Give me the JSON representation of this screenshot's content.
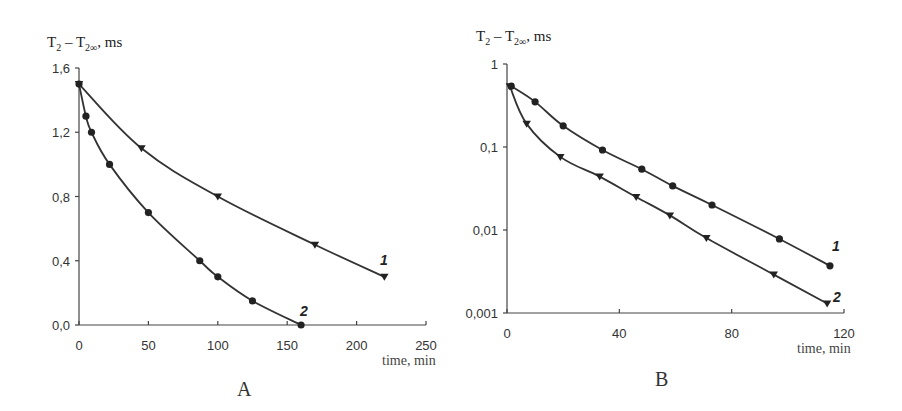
{
  "chart_data": [
    {
      "panel": "A",
      "type": "line",
      "title": "",
      "ylabel": "T2 – T2∞, ms",
      "xlabel": "time, min",
      "xlim": [
        0,
        250
      ],
      "ylim": [
        0,
        1.6
      ],
      "yscale": "linear",
      "x_ticks": [
        "0",
        "50",
        "100",
        "150",
        "200",
        "250"
      ],
      "y_ticks": [
        "0,0",
        "0,4",
        "0,8",
        "1,2",
        "1,6"
      ],
      "grid": false,
      "series": [
        {
          "name": "1",
          "marker": "triangle-down",
          "x": [
            0,
            45,
            100,
            170,
            220
          ],
          "y": [
            1.5,
            1.1,
            0.8,
            0.5,
            0.3
          ]
        },
        {
          "name": "2",
          "marker": "circle",
          "x": [
            0,
            5,
            9,
            22,
            50,
            87,
            100,
            125,
            160
          ],
          "y": [
            1.5,
            1.3,
            1.2,
            1.0,
            0.7,
            0.4,
            0.3,
            0.15,
            0.0
          ]
        }
      ]
    },
    {
      "panel": "B",
      "type": "line",
      "title": "",
      "ylabel": "T2 – T2∞, ms",
      "xlabel": "time, min",
      "xlim": [
        0,
        120
      ],
      "ylim": [
        0.001,
        1
      ],
      "yscale": "log",
      "x_ticks": [
        "0",
        "40",
        "80",
        "120"
      ],
      "y_ticks": [
        "0,001",
        "0,01",
        "0,1",
        "1"
      ],
      "grid": false,
      "series": [
        {
          "name": "1",
          "marker": "circle",
          "x": [
            1.5,
            10,
            20,
            34,
            48,
            59,
            73,
            97,
            115
          ],
          "y": [
            0.54,
            0.35,
            0.18,
            0.092,
            0.054,
            0.034,
            0.02,
            0.0078,
            0.0037
          ]
        },
        {
          "name": "2",
          "marker": "triangle-down",
          "x": [
            1,
            7,
            19,
            33,
            46,
            58,
            71,
            95,
            114
          ],
          "y": [
            0.54,
            0.19,
            0.076,
            0.044,
            0.025,
            0.015,
            0.008,
            0.0029,
            0.0013
          ]
        }
      ]
    }
  ],
  "labels": {
    "a": {
      "ylabel_main": "T",
      "ylabel_sub1": "2",
      "ylabel_mid": " – T",
      "ylabel_sub2": "2∞",
      "ylabel_tail": ", ms",
      "xlabel": "time, min",
      "panel": "A",
      "series1": "1",
      "series2": "2"
    },
    "b": {
      "ylabel_main": "T",
      "ylabel_sub1": "2",
      "ylabel_mid": " – T",
      "ylabel_sub2": "2∞",
      "ylabel_tail": ", ms",
      "xlabel": "time, min",
      "panel": "B",
      "series1": "1",
      "series2": "2"
    }
  }
}
